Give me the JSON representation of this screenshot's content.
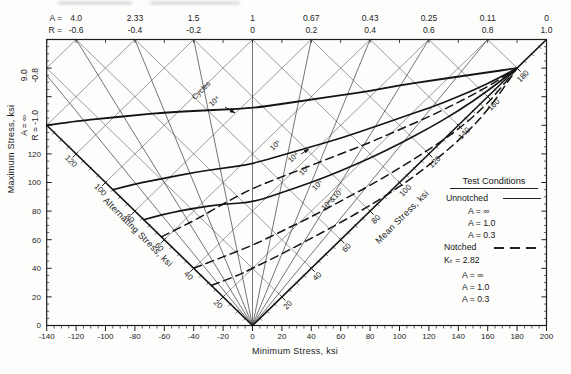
{
  "chart_data": {
    "type": "line",
    "title": "",
    "axes": {
      "x": {
        "title": "Minimum Stress, ksi",
        "range": [
          -140,
          200
        ],
        "major_tick": 20,
        "minor_tick": 5,
        "tick_labels": [
          -140,
          -120,
          -100,
          -80,
          -60,
          -40,
          -20,
          0,
          20,
          40,
          60,
          80,
          100,
          120,
          140,
          160,
          180,
          200
        ]
      },
      "y": {
        "title": "Maximum Stress, ksi",
        "range": [
          0,
          200
        ],
        "major_tick": 20,
        "minor_tick": 5,
        "tick_labels": [
          0,
          20,
          40,
          60,
          80,
          100,
          120
        ]
      },
      "alternating": {
        "title": "Alternating Stress, ksi",
        "range": [
          0,
          140
        ],
        "tick_labels": [
          20,
          40,
          60,
          80,
          100,
          120
        ]
      },
      "mean": {
        "title": "Mean Stress, ksi",
        "range": [
          0,
          200
        ],
        "tick_labels": [
          20,
          40,
          60,
          80,
          100,
          120,
          140,
          160,
          180
        ]
      }
    },
    "top_scale": {
      "a_prefix": "A =",
      "r_prefix": "R =",
      "entries": [
        {
          "a": "4.0",
          "r": "-0.6",
          "min": -120
        },
        {
          "a": "2.33",
          "r": "-0.4",
          "min": -80
        },
        {
          "a": "1.5",
          "r": "-0.2",
          "min": -40
        },
        {
          "a": "1",
          "r": "0",
          "min": 0
        },
        {
          "a": "0.67",
          "r": "0.2",
          "min": 40
        },
        {
          "a": "0.43",
          "r": "0.4",
          "min": 80
        },
        {
          "a": "0.25",
          "r": "0.6",
          "min": 120
        },
        {
          "a": "0.11",
          "r": "0.8",
          "min": 160
        },
        {
          "a": "0",
          "r": "1.0",
          "min": 200
        }
      ],
      "left_edge_entries": [
        {
          "a": "9.0",
          "r": "-0.8",
          "max": 175
        },
        {
          "a": "A = ∞",
          "r": "R = -1.0",
          "max": 140
        }
      ]
    },
    "fan_rays": [
      {
        "A": "∞",
        "R": -1.0
      },
      {
        "A": "9.0",
        "R": -0.8
      },
      {
        "A": "4.0",
        "R": -0.6
      },
      {
        "A": "2.33",
        "R": -0.4
      },
      {
        "A": "1.5",
        "R": -0.2
      },
      {
        "A": "1",
        "R": 0.0
      },
      {
        "A": "0.67",
        "R": 0.2
      },
      {
        "A": "0.43",
        "R": 0.4
      },
      {
        "A": "0.25",
        "R": 0.6
      },
      {
        "A": "0.11",
        "R": 0.8
      },
      {
        "A": "0",
        "R": 1.0
      }
    ],
    "grid": {
      "alternating_lines": [
        20,
        40,
        60,
        80,
        100,
        120,
        140,
        160
      ],
      "mean_lines": [
        20,
        40,
        60,
        80,
        100,
        120,
        140,
        160,
        180
      ]
    },
    "series": [
      {
        "name": "Unnotched 10⁴ cycles",
        "style": "solid",
        "points": [
          [
            -140,
            140
          ],
          [
            -120,
            143
          ],
          [
            -100,
            145
          ],
          [
            -80,
            147
          ],
          [
            -60,
            149
          ],
          [
            -40,
            150
          ],
          [
            -20,
            151
          ],
          [
            0,
            152
          ],
          [
            20,
            155
          ],
          [
            40,
            158
          ],
          [
            60,
            161
          ],
          [
            80,
            164
          ],
          [
            100,
            168
          ],
          [
            120,
            171
          ],
          [
            140,
            174
          ],
          [
            160,
            177
          ],
          [
            180,
            180
          ]
        ]
      },
      {
        "name": "Unnotched 10⁵ cycles",
        "style": "solid",
        "points": [
          [
            -95,
            95
          ],
          [
            -80,
            99
          ],
          [
            -60,
            103
          ],
          [
            -40,
            107
          ],
          [
            -20,
            110
          ],
          [
            0,
            113
          ],
          [
            20,
            119
          ],
          [
            40,
            125
          ],
          [
            60,
            131
          ],
          [
            80,
            138
          ],
          [
            100,
            145
          ],
          [
            120,
            152
          ],
          [
            140,
            160
          ],
          [
            160,
            169
          ],
          [
            180,
            180
          ]
        ]
      },
      {
        "name": "Unnotched 10⁶ cycles",
        "style": "solid",
        "points": [
          [
            -74,
            74
          ],
          [
            -60,
            78
          ],
          [
            -40,
            82
          ],
          [
            -20,
            85
          ],
          [
            0,
            86
          ],
          [
            20,
            93
          ],
          [
            40,
            100
          ],
          [
            60,
            108
          ],
          [
            80,
            117
          ],
          [
            100,
            127
          ],
          [
            120,
            138
          ],
          [
            140,
            150
          ],
          [
            160,
            164
          ],
          [
            180,
            180
          ]
        ]
      },
      {
        "name": "Notched 10⁴ cycles",
        "style": "dashed",
        "points": [
          [
            -62,
            62
          ],
          [
            -40,
            73
          ],
          [
            -20,
            85
          ],
          [
            0,
            96
          ],
          [
            20,
            104
          ],
          [
            40,
            112
          ],
          [
            60,
            120
          ],
          [
            80,
            128
          ],
          [
            100,
            137
          ],
          [
            120,
            146
          ],
          [
            140,
            156
          ],
          [
            160,
            167
          ],
          [
            180,
            180
          ]
        ]
      },
      {
        "name": "Notched 10⁵ cycles",
        "style": "dashed",
        "points": [
          [
            -40,
            40
          ],
          [
            -20,
            48
          ],
          [
            0,
            56
          ],
          [
            20,
            66
          ],
          [
            40,
            76
          ],
          [
            60,
            87
          ],
          [
            80,
            98
          ],
          [
            100,
            110
          ],
          [
            120,
            123
          ],
          [
            140,
            137
          ],
          [
            160,
            155
          ],
          [
            180,
            180
          ]
        ]
      },
      {
        "name": "Notched 10⁶ & 10⁷ cycles",
        "style": "dashed",
        "points": [
          [
            -28,
            28
          ],
          [
            -10,
            35
          ],
          [
            0,
            40
          ],
          [
            20,
            50
          ],
          [
            40,
            61
          ],
          [
            60,
            72
          ],
          [
            80,
            84
          ],
          [
            100,
            97
          ],
          [
            120,
            112
          ],
          [
            140,
            129
          ],
          [
            160,
            150
          ],
          [
            180,
            180
          ]
        ]
      }
    ],
    "curve_labels": [
      {
        "text": "Cycles",
        "x": 203,
        "y": 92,
        "rot": -45
      },
      {
        "text": "10⁴",
        "x": 216,
        "y": 103,
        "rot": -45,
        "arrow": [
          225,
          107,
          235,
          113
        ]
      },
      {
        "text": "10⁵",
        "x": 277,
        "y": 147,
        "rot": -45
      },
      {
        "text": "10⁴",
        "x": 295,
        "y": 159,
        "rot": -45,
        "arrow": [
          301,
          154,
          309,
          149
        ]
      },
      {
        "text": "10⁶",
        "x": 306,
        "y": 172,
        "rot": -45
      },
      {
        "text": "10⁵",
        "x": 319,
        "y": 187,
        "rot": -45
      },
      {
        "text": "10⁶&10⁷",
        "x": 334,
        "y": 201,
        "rot": -45
      }
    ],
    "legend": {
      "title": "Test Conditions",
      "unnotched_label": "Unnotched",
      "unnotched_items": [
        "A = ∞",
        "A = 1.0",
        "A = 0.3"
      ],
      "notched_label": "Notched",
      "kt": "Kₜ = 2.82",
      "notched_items": [
        "A = ∞",
        "A = 1.0",
        "A = 0.3"
      ]
    },
    "ultimate_strength_ksi": 180,
    "legend_position": "right-middle",
    "grid_on": true
  }
}
